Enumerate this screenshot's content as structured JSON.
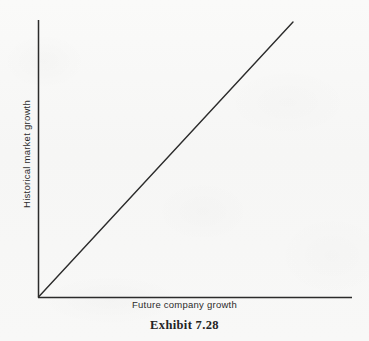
{
  "figure": {
    "caption": "Exhibit 7.28",
    "background_color": "#f7f7f6",
    "ink_color": "#2b2b2b"
  },
  "chart_data": {
    "type": "line",
    "title": "",
    "subtitle": "",
    "xlabel": "Future company growth",
    "ylabel": "Historical market growth",
    "xlim": [
      0,
      1
    ],
    "ylim": [
      0,
      1
    ],
    "grid": false,
    "legend": false,
    "legend_position": "none",
    "xticks": [],
    "yticks": [],
    "xticklabels": [],
    "yticklabels": [],
    "annotations": [],
    "series": [
      {
        "name": "identity relationship",
        "x": [
          0,
          1
        ],
        "y": [
          0,
          1
        ],
        "color": "#2b2b2b",
        "linewidth": 1.4,
        "style": "solid",
        "markers": false
      }
    ],
    "axes": {
      "spines": [
        "left",
        "bottom"
      ],
      "origin_px": [
        38,
        297
      ],
      "x_axis_end_px": [
        352,
        297
      ],
      "y_axis_top_px": [
        38,
        20
      ],
      "line_start_px": [
        38,
        297
      ],
      "line_end_px": [
        293,
        22
      ]
    }
  }
}
